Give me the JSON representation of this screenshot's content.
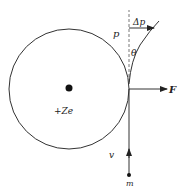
{
  "diagram": {
    "nucleus": {
      "label": "+Ze"
    },
    "particle": {
      "label": "m"
    },
    "velocity": {
      "label": "v"
    },
    "momentum": {
      "label": "p"
    },
    "angle": {
      "label": "θ"
    },
    "momentum_change": {
      "label": "Δp"
    },
    "force": {
      "label": "F"
    },
    "colors": {
      "stroke": "#333333",
      "fill": "#111111",
      "dashed": "#555555"
    }
  }
}
